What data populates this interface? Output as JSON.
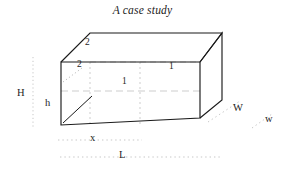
{
  "figure": {
    "title": "A case study",
    "type": "3d-box-dimension-diagram",
    "stroke_color": "#1a1a1a",
    "guide_color": "#b4b4b4",
    "background": "#ffffff"
  },
  "labels": {
    "outer_height": "H",
    "inner_height": "h",
    "inner_length": "x",
    "outer_length": "L",
    "outer_width": "W",
    "inner_width": "w",
    "thickness_mid": "1",
    "thickness_right": "1",
    "thickness_left": "2",
    "thickness_top": "2"
  },
  "box": {
    "front_top_left": [
      61,
      62
    ],
    "front_top_right": [
      200,
      62
    ],
    "front_bottom_left": [
      61,
      125
    ],
    "front_bottom_right": [
      200,
      118
    ],
    "back_top_left": [
      90,
      33
    ],
    "back_top_right": [
      222,
      33
    ],
    "back_bottom_right": [
      222,
      100
    ]
  },
  "guides": {
    "height_line_x": 33,
    "height_line_y1": 58,
    "height_line_y2": 128,
    "inner_length_line_y": 140,
    "outer_length_line_y": 157,
    "inner_length_x1": 61,
    "inner_length_x2": 140,
    "outer_length_x1": 61,
    "outer_length_x2": 222
  }
}
